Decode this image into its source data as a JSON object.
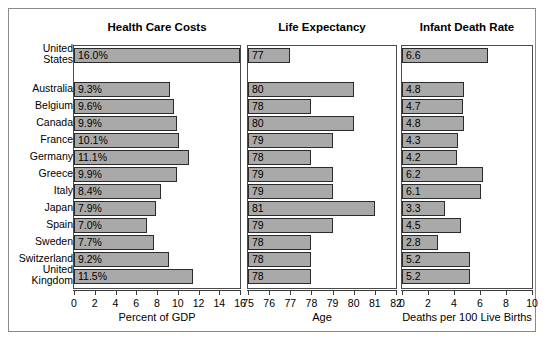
{
  "chart_data": {
    "type": "bar",
    "layout": "three horizontal bar panels sharing one country axis",
    "categories": [
      "United States",
      "Australia",
      "Belgium",
      "Canada",
      "France",
      "Germany",
      "Greece",
      "Italy",
      "Japan",
      "Spain",
      "Sweden",
      "Switzerland",
      "United Kingdom"
    ],
    "panels": [
      {
        "title": "Health Care Costs",
        "xlabel": "Percent of GDP",
        "xlim": [
          0,
          16
        ],
        "xticks": [
          "0",
          "2",
          "4",
          "6",
          "8",
          "10",
          "12",
          "14",
          "16"
        ],
        "tickvalues": [
          0,
          2,
          4,
          6,
          8,
          10,
          12,
          14,
          16
        ],
        "values": [
          16.0,
          9.3,
          9.6,
          9.9,
          10.1,
          11.1,
          9.9,
          8.4,
          7.9,
          7.0,
          7.7,
          9.2,
          11.5
        ],
        "labels": [
          "16.0%",
          "9.3%",
          "9.6%",
          "9.9%",
          "10.1%",
          "11.1%",
          "9.9%",
          "8.4%",
          "7.9%",
          "7.0%",
          "7.7%",
          "9.2%",
          "11.5%"
        ]
      },
      {
        "title": "Life Expectancy",
        "xlabel": "Age",
        "xlim": [
          75,
          82
        ],
        "xticks": [
          "75",
          "76",
          "77",
          "78",
          "79",
          "80",
          "81",
          "82"
        ],
        "tickvalues": [
          75,
          76,
          77,
          78,
          79,
          80,
          81,
          82
        ],
        "values": [
          77,
          80,
          78,
          80,
          79,
          78,
          79,
          79,
          81,
          79,
          78,
          78,
          78
        ],
        "labels": [
          "77",
          "80",
          "78",
          "80",
          "79",
          "78",
          "79",
          "79",
          "81",
          "79",
          "78",
          "78",
          "78"
        ]
      },
      {
        "title": "Infant Death Rate",
        "xlabel": "Deaths per 100 Live Births",
        "xlim": [
          0,
          10
        ],
        "xticks": [
          "0",
          "2",
          "4",
          "6",
          "8",
          "10"
        ],
        "tickvalues": [
          0,
          2,
          4,
          6,
          8,
          10
        ],
        "values": [
          6.6,
          4.8,
          4.7,
          4.8,
          4.3,
          4.2,
          6.2,
          6.1,
          3.3,
          4.5,
          2.8,
          5.2,
          5.2
        ],
        "labels": [
          "6.6",
          "4.8",
          "4.7",
          "4.8",
          "4.3",
          "4.2",
          "6.2",
          "6.1",
          "3.3",
          "4.5",
          "2.8",
          "5.2",
          "5.2"
        ]
      }
    ],
    "colors": {
      "bar_fill": "#a9a9a9",
      "bar_border": "#2b2b2b",
      "panel_border": "#4a4a4a",
      "frame_border": "#8a8a8a",
      "text": "#000000",
      "background": "#ffffff"
    },
    "grid": false,
    "legend": null
  }
}
